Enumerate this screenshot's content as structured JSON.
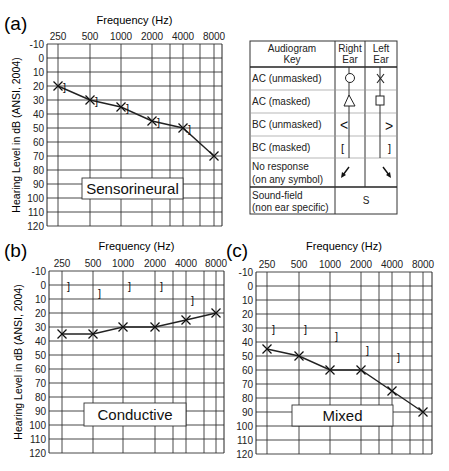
{
  "chart_data": [
    {
      "type": "line",
      "panel": "(a)",
      "title": "Sensorineural",
      "xlabel": "Frequency (Hz)",
      "ylabel": "Hearing Level in dB (ANSI, 2004)",
      "categories": [
        "250",
        "500",
        "1000",
        "2000",
        "4000",
        "8000"
      ],
      "y_ticks": [
        -10,
        0,
        10,
        20,
        30,
        40,
        50,
        60,
        70,
        80,
        90,
        100,
        110,
        120
      ],
      "ylim": [
        -10,
        120
      ],
      "y_inverted": true,
      "grid": true,
      "series": [
        {
          "name": "AC (unmasked) Left Ear",
          "symbol": "X",
          "values": [
            20,
            30,
            35,
            45,
            50,
            70
          ]
        },
        {
          "name": "BC (masked) Left Ear",
          "symbol": "]",
          "values": [
            20,
            30,
            35,
            45,
            50,
            null
          ]
        }
      ]
    },
    {
      "type": "line",
      "panel": "(b)",
      "title": "Conductive",
      "xlabel": "Frequency (Hz)",
      "ylabel": "Hearing Level in dB (ANSI, 2004)",
      "categories": [
        "250",
        "500",
        "1000",
        "2000",
        "4000",
        "8000"
      ],
      "y_ticks": [
        -10,
        0,
        10,
        20,
        30,
        40,
        50,
        60,
        70,
        80,
        90,
        100,
        110,
        120
      ],
      "ylim": [
        -10,
        120
      ],
      "y_inverted": true,
      "grid": true,
      "series": [
        {
          "name": "AC (unmasked) Left Ear",
          "symbol": "X",
          "values": [
            35,
            35,
            30,
            30,
            25,
            20
          ]
        },
        {
          "name": "BC (masked) Left Ear",
          "symbol": "]",
          "values": [
            0,
            5,
            0,
            0,
            10,
            null
          ]
        }
      ]
    },
    {
      "type": "line",
      "panel": "(c)",
      "title": "Mixed",
      "xlabel": "Frequency (Hz)",
      "ylabel": "",
      "categories": [
        "250",
        "500",
        "1000",
        "2000",
        "4000",
        "8000"
      ],
      "y_ticks": [
        -10,
        0,
        10,
        20,
        30,
        40,
        50,
        60,
        70,
        80,
        90,
        100,
        110,
        120
      ],
      "ylim": [
        -10,
        120
      ],
      "y_inverted": true,
      "grid": true,
      "series": [
        {
          "name": "AC (unmasked) Left Ear",
          "symbol": "X",
          "values": [
            45,
            50,
            60,
            60,
            75,
            90
          ]
        },
        {
          "name": "BC (masked) Left Ear",
          "symbol": "]",
          "values": [
            30,
            30,
            35,
            45,
            50,
            null
          ]
        }
      ]
    }
  ],
  "panels": {
    "a": {
      "letter": "(a)",
      "xtitle": "Frequency (Hz)",
      "ylabel": "Hearing Level in dB (ANSI, 2004)",
      "type_label": "Sensorineural"
    },
    "b": {
      "letter": "(b)",
      "xtitle": "Frequency (Hz)",
      "ylabel": "Hearing Level in dB (ANSI, 2004)",
      "type_label": "Conductive"
    },
    "c": {
      "letter": "(c)",
      "xtitle": "Frequency (Hz)",
      "type_label": "Mixed"
    }
  },
  "legend": {
    "header": {
      "key_line1": "Audiogram",
      "key_line2": "Key",
      "right_line1": "Right",
      "right_line2": "Ear",
      "left_line1": "Left",
      "left_line2": "Ear"
    },
    "rows": [
      {
        "label": "AC (unmasked)",
        "right": "circle-icon",
        "left": "x-icon"
      },
      {
        "label": "AC (masked)",
        "right": "triangle-icon",
        "left": "square-icon"
      },
      {
        "label": "BC (unmasked)",
        "right": "<",
        "left": ">"
      },
      {
        "label": "BC (masked)",
        "right": "[",
        "left": "]"
      },
      {
        "label_line1": "No response",
        "label_line2": "(on any symbol)",
        "right": "arrow-down-left-icon",
        "left": "arrow-down-right-icon"
      },
      {
        "label_line1": "Sound-field",
        "label_line2": "(non ear specific)",
        "both": "S"
      }
    ]
  }
}
